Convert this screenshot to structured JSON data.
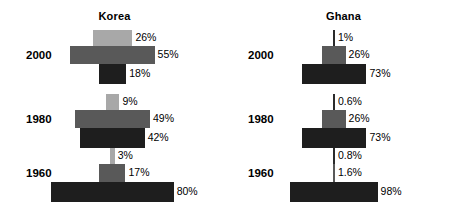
{
  "chart_data": {
    "type": "bar",
    "title": "",
    "subtitle": "",
    "xlabel": "",
    "ylabel": "",
    "orientation": "horizontal-centered",
    "grid": false,
    "legend_position": "none",
    "note": "Centered (butterfly) bar chart: three nested bars per year, each centered on a common vertical axis; bar width is proportional to the percentage value.",
    "panels": [
      {
        "name": "Korea",
        "rows": [
          {
            "year": "2000",
            "bars": [
              {
                "value": 26,
                "label": "26%",
                "tone": "light"
              },
              {
                "value": 55,
                "label": "55%",
                "tone": "medium"
              },
              {
                "value": 18,
                "label": "18%",
                "tone": "dark"
              }
            ]
          },
          {
            "year": "1980",
            "bars": [
              {
                "value": 9,
                "label": "9%",
                "tone": "light"
              },
              {
                "value": 49,
                "label": "49%",
                "tone": "medium"
              },
              {
                "value": 42,
                "label": "42%",
                "tone": "dark"
              }
            ]
          },
          {
            "year": "1960",
            "bars": [
              {
                "value": 3,
                "label": "3%",
                "tone": "light"
              },
              {
                "value": 17,
                "label": "17%",
                "tone": "medium"
              },
              {
                "value": 80,
                "label": "80%",
                "tone": "dark"
              }
            ]
          }
        ]
      },
      {
        "name": "Ghana",
        "rows": [
          {
            "year": "2000",
            "bars": [
              {
                "value": 1,
                "label": "1%",
                "tone": "light"
              },
              {
                "value": 26,
                "label": "26%",
                "tone": "medium"
              },
              {
                "value": 73,
                "label": "73%",
                "tone": "dark"
              }
            ]
          },
          {
            "year": "1980",
            "bars": [
              {
                "value": 0.6,
                "label": "0.6%",
                "tone": "light"
              },
              {
                "value": 26,
                "label": "26%",
                "tone": "medium"
              },
              {
                "value": 73,
                "label": "73%",
                "tone": "dark"
              }
            ]
          },
          {
            "year": "1960",
            "bars": [
              {
                "value": 0.8,
                "label": "0.8%",
                "tone": "light"
              },
              {
                "value": 1.6,
                "label": "1.6%",
                "tone": "medium"
              },
              {
                "value": 98,
                "label": "98%",
                "tone": "dark"
              }
            ]
          }
        ]
      }
    ],
    "colors": {
      "light": "#a8a8a8",
      "medium": "#595959",
      "dark": "#1e1e1e",
      "axis": "#2b2b2b",
      "background": "#ffffff",
      "text": "#000000"
    }
  }
}
